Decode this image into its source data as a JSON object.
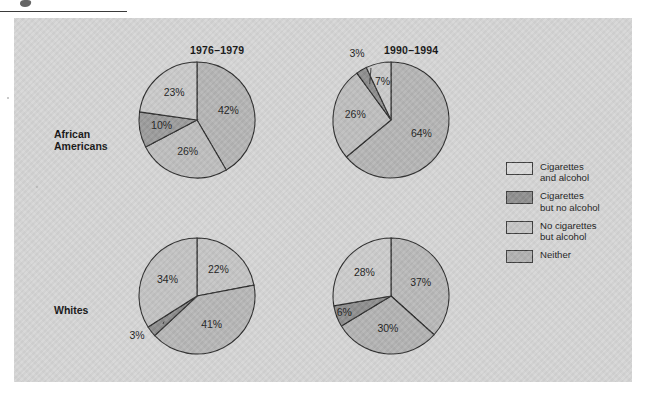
{
  "figure": {
    "panel_bg": "#d5d5d5",
    "row_labels": [
      {
        "id": "african-americans",
        "text": "African\nAmericans"
      },
      {
        "id": "whites",
        "text": "Whites"
      }
    ],
    "column_titles": [
      {
        "id": "period-1",
        "text": "1976–1979"
      },
      {
        "id": "period-2",
        "text": "1990–1994"
      }
    ]
  },
  "legend": {
    "position": "right",
    "items": [
      {
        "label": "Cigarettes\nand alcohol",
        "color": "#d9d9d9"
      },
      {
        "label": "Cigarettes\nbut no alcohol",
        "color": "#8e8e8e"
      },
      {
        "label": "No cigarettes\nbut alcohol",
        "color": "#c6c6c6"
      },
      {
        "label": "Neither",
        "color": "#b1b1b1"
      }
    ]
  },
  "chart_data": [
    {
      "type": "pie",
      "title": "1976–1979",
      "group": "African Americans",
      "categories": [
        "Cigarettes and alcohol",
        "Cigarettes but no alcohol",
        "No cigarettes but alcohol",
        "Neither"
      ],
      "values": [
        42,
        26,
        10,
        23
      ],
      "labels": [
        "42%",
        "26%",
        "10%",
        "23%"
      ],
      "colors": [
        "#b4b4b4",
        "#bdbdbd",
        "#9a9a9a",
        "#c9c9c9"
      ]
    },
    {
      "type": "pie",
      "title": "1990–1994",
      "group": "African Americans",
      "categories": [
        "Cigarettes and alcohol",
        "Cigarettes but no alcohol",
        "No cigarettes but alcohol",
        "Neither"
      ],
      "values": [
        64,
        26,
        3,
        7
      ],
      "labels": [
        "64%",
        "26%",
        "3%",
        "7%"
      ],
      "colors": [
        "#b4b4b4",
        "#bdbdbd",
        "#8d8d8d",
        "#c9c9c9"
      ]
    },
    {
      "type": "pie",
      "title": "1976–1979",
      "group": "Whites",
      "categories": [
        "Cigarettes and alcohol",
        "Cigarettes but no alcohol",
        "No cigarettes but alcohol",
        "Neither"
      ],
      "values": [
        22,
        41,
        3,
        34
      ],
      "labels": [
        "22%",
        "41%",
        "3%",
        "34%"
      ],
      "colors": [
        "#c4c4c4",
        "#b6b6b6",
        "#8d8d8d",
        "#c2c2c2"
      ]
    },
    {
      "type": "pie",
      "title": "1990–1994",
      "group": "Whites",
      "categories": [
        "Cigarettes and alcohol",
        "Cigarettes but no alcohol",
        "No cigarettes but alcohol",
        "Neither"
      ],
      "values": [
        37,
        30,
        6,
        28
      ],
      "labels": [
        "37%",
        "30%",
        "6%",
        "28%"
      ],
      "colors": [
        "#b8b8b8",
        "#b2b2b2",
        "#8d8d8d",
        "#cbcbcb"
      ]
    }
  ]
}
